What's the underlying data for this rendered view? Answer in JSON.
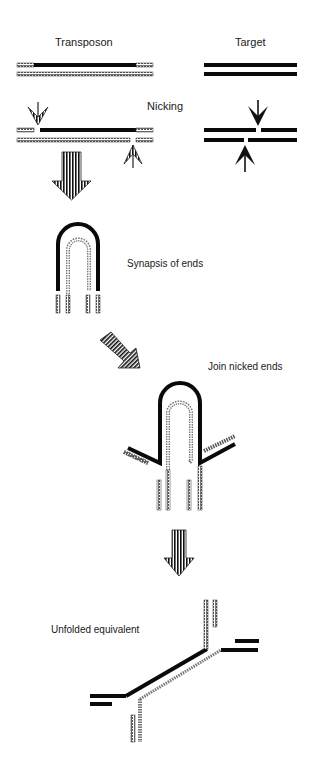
{
  "diagram": {
    "labels": {
      "transposon": "Transposon",
      "target": "Target",
      "nicking": "Nicking",
      "synapsis": "Synapsis of ends",
      "join": "Join nicked ends",
      "unfolded": "Unfolded equivalent"
    },
    "steps": [
      {
        "id": "initial",
        "description": "Transposon and Target DNA duplexes"
      },
      {
        "id": "nicking",
        "description": "Nicking"
      },
      {
        "id": "synapsis",
        "description": "Synapsis of ends"
      },
      {
        "id": "join",
        "description": "Join nicked ends"
      },
      {
        "id": "unfolded",
        "description": "Unfolded equivalent"
      }
    ],
    "colors": {
      "solid_strand": "#0a0a0a",
      "hatched_strand": "#6e6e6e",
      "background": "#ffffff"
    }
  }
}
